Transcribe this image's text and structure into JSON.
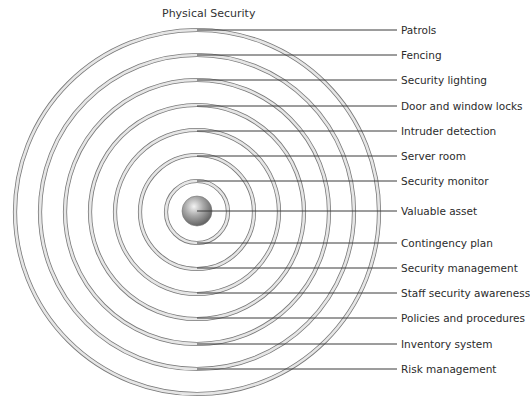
{
  "title": "Physical Security",
  "center": {
    "x": 197,
    "y": 212
  },
  "sphere": {
    "label": "Valuable asset",
    "radius": 15
  },
  "ring_radii": [
    182,
    157,
    132,
    107,
    82,
    57,
    31
  ],
  "line_end_x": 397,
  "label_x": 401,
  "labels": [
    {
      "text": "Patrols",
      "y": 30,
      "ring": 0,
      "side": "top"
    },
    {
      "text": "Fencing",
      "y": 55,
      "ring": 1,
      "side": "top"
    },
    {
      "text": "Security lighting",
      "y": 80,
      "ring": 2,
      "side": "top"
    },
    {
      "text": "Door and window locks",
      "y": 106,
      "ring": 3,
      "side": "top"
    },
    {
      "text": "Intruder detection",
      "y": 131,
      "ring": 4,
      "side": "top"
    },
    {
      "text": "Server room",
      "y": 156,
      "ring": 5,
      "side": "top"
    },
    {
      "text": "Security monitor",
      "y": 181,
      "ring": 6,
      "side": "top"
    },
    {
      "text": "Valuable asset",
      "y": 211,
      "ring": -1,
      "side": "center"
    },
    {
      "text": "Contingency plan",
      "y": 243,
      "ring": 6,
      "side": "bottom"
    },
    {
      "text": "Security management",
      "y": 268,
      "ring": 5,
      "side": "bottom"
    },
    {
      "text": "Staff security awareness",
      "y": 293,
      "ring": 4,
      "side": "bottom"
    },
    {
      "text": "Policies and procedures",
      "y": 318,
      "ring": 3,
      "side": "bottom"
    },
    {
      "text": "Inventory system",
      "y": 344,
      "ring": 2,
      "side": "bottom"
    },
    {
      "text": "Risk management",
      "y": 369,
      "ring": 1,
      "side": "bottom"
    }
  ],
  "colors": {
    "ring_fill": "#e6e6e6",
    "ring_stroke": "#7a7a7a",
    "leader_line": "#3a3a3a",
    "text": "#2b2b2b",
    "sphere_light": "#f0f0f0",
    "sphere_dark": "#6a6a6a"
  }
}
